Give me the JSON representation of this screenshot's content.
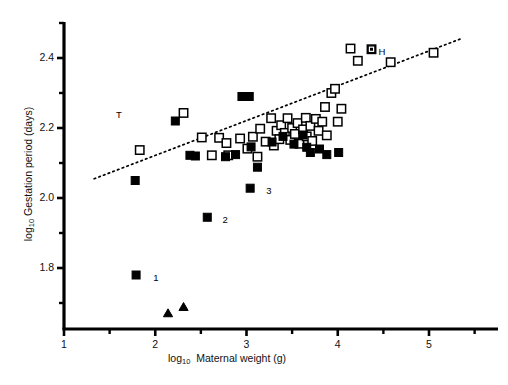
{
  "figure": {
    "background": "#ffffff",
    "ink": "#000000"
  },
  "axes": {
    "x": {
      "label_prefix": "log",
      "label_sub": "10",
      "label_text": "Maternal weight (g)",
      "ticks": [
        "1",
        "2",
        "3",
        "4",
        "5"
      ],
      "range": [
        1,
        5.7
      ],
      "minor_ticks": true
    },
    "y": {
      "label_prefix": "log",
      "label_sub": "10",
      "label_text": "Gestation period (days)",
      "ticks": [
        "2.4",
        "2.2",
        "2.0",
        "1.8"
      ],
      "range": [
        1.66,
        2.49
      ],
      "minor_ticks": true
    }
  },
  "annotations": [
    {
      "text": "T",
      "x": 1.745,
      "y": 2.245,
      "anchor": "right"
    },
    {
      "text": "H",
      "x": 4.37,
      "y": 2.425,
      "anchor": "left"
    },
    {
      "text": "1",
      "x": 1.9,
      "y": 1.78,
      "anchor": "left"
    },
    {
      "text": "2",
      "x": 2.66,
      "y": 1.945,
      "anchor": "left"
    },
    {
      "text": "3",
      "x": 3.14,
      "y": 2.028,
      "anchor": "left"
    }
  ],
  "chart_data": {
    "type": "scatter",
    "title": "",
    "xlabel": "log10 Maternal weight (g)",
    "ylabel": "log10 Gestation period (days)",
    "xlim": [
      1,
      5.7
    ],
    "ylim": [
      1.66,
      2.49
    ],
    "grid": false,
    "legend": "none",
    "series": [
      {
        "name": "open-square",
        "marker": "open_square",
        "fill": "none",
        "stroke": "#000000",
        "points": [
          [
            1.83,
            2.137
          ],
          [
            2.31,
            2.243
          ],
          [
            2.51,
            2.173
          ],
          [
            2.62,
            2.122
          ],
          [
            2.7,
            2.172
          ],
          [
            2.78,
            2.157
          ],
          [
            2.8,
            2.122
          ],
          [
            2.93,
            2.17
          ],
          [
            3.01,
            2.141
          ],
          [
            3.07,
            2.175
          ],
          [
            3.12,
            2.118
          ],
          [
            3.15,
            2.198
          ],
          [
            3.21,
            2.161
          ],
          [
            3.27,
            2.228
          ],
          [
            3.3,
            2.15
          ],
          [
            3.33,
            2.192
          ],
          [
            3.36,
            2.168
          ],
          [
            3.38,
            2.208
          ],
          [
            3.42,
            2.186
          ],
          [
            3.45,
            2.228
          ],
          [
            3.48,
            2.166
          ],
          [
            3.5,
            2.2
          ],
          [
            3.53,
            2.183
          ],
          [
            3.56,
            2.214
          ],
          [
            3.58,
            2.155
          ],
          [
            3.62,
            2.196
          ],
          [
            3.65,
            2.229
          ],
          [
            3.66,
            2.176
          ],
          [
            3.7,
            2.206
          ],
          [
            3.72,
            2.163
          ],
          [
            3.76,
            2.226
          ],
          [
            3.79,
            2.192
          ],
          [
            3.83,
            2.218
          ],
          [
            3.86,
            2.26
          ],
          [
            3.88,
            2.179
          ],
          [
            3.93,
            2.3
          ],
          [
            3.97,
            2.312
          ],
          [
            4.0,
            2.218
          ],
          [
            4.04,
            2.255
          ],
          [
            4.14,
            2.427
          ],
          [
            4.22,
            2.392
          ],
          [
            4.37,
            2.425
          ],
          [
            4.58,
            2.388
          ],
          [
            5.05,
            2.415
          ]
        ]
      },
      {
        "name": "filled-square",
        "marker": "filled_square",
        "fill": "#000000",
        "stroke": "#000000",
        "points": [
          [
            1.79,
            1.78
          ],
          [
            1.78,
            2.05
          ],
          [
            2.22,
            2.22
          ],
          [
            2.38,
            2.122
          ],
          [
            2.44,
            2.12
          ],
          [
            2.57,
            1.945
          ],
          [
            2.77,
            2.118
          ],
          [
            2.88,
            2.124
          ],
          [
            2.95,
            2.29
          ],
          [
            3.03,
            2.29
          ],
          [
            3.04,
            2.028
          ],
          [
            3.05,
            2.146
          ],
          [
            3.12,
            2.088
          ],
          [
            3.28,
            2.16
          ],
          [
            3.4,
            2.176
          ],
          [
            3.52,
            2.154
          ],
          [
            3.62,
            2.18
          ],
          [
            3.66,
            2.145
          ],
          [
            3.7,
            2.13
          ],
          [
            3.8,
            2.14
          ],
          [
            3.88,
            2.124
          ],
          [
            4.01,
            2.13
          ]
        ]
      },
      {
        "name": "filled-triangle",
        "marker": "filled_triangle",
        "fill": "#000000",
        "stroke": "#000000",
        "points": [
          [
            2.14,
            1.672
          ],
          [
            2.31,
            1.69
          ]
        ]
      }
    ],
    "trendline": {
      "style": "dotted",
      "stroke": "#000000",
      "x0": 1.33,
      "y0": 2.055,
      "x1": 5.35,
      "y1": 2.455
    }
  }
}
